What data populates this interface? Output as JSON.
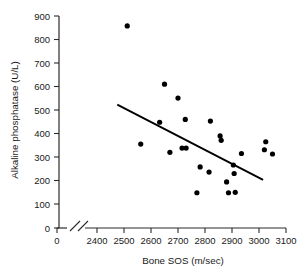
{
  "chart_data": {
    "type": "scatter",
    "title": "",
    "xlabel": "Bone SOS (m/sec)",
    "ylabel": "Alkaline phosphatase (U/L)",
    "xlim": [
      2400,
      3100
    ],
    "ylim": [
      0,
      900
    ],
    "x_ticks": [
      0,
      2400,
      2500,
      2600,
      2700,
      2800,
      2900,
      3000,
      3100
    ],
    "y_ticks": [
      0,
      100,
      200,
      300,
      400,
      500,
      600,
      700,
      800,
      900
    ],
    "x_axis_break": true,
    "grid": false,
    "legend": null,
    "series": [
      {
        "name": "Subjects",
        "marker": "filled-circle",
        "color": "#000000",
        "points": [
          {
            "x": 2512,
            "y": 860
          },
          {
            "x": 2562,
            "y": 357
          },
          {
            "x": 2650,
            "y": 612
          },
          {
            "x": 2632,
            "y": 450
          },
          {
            "x": 2700,
            "y": 553
          },
          {
            "x": 2670,
            "y": 322
          },
          {
            "x": 2727,
            "y": 462
          },
          {
            "x": 2715,
            "y": 340
          },
          {
            "x": 2730,
            "y": 340
          },
          {
            "x": 2782,
            "y": 260
          },
          {
            "x": 2770,
            "y": 150
          },
          {
            "x": 2820,
            "y": 455
          },
          {
            "x": 2815,
            "y": 238
          },
          {
            "x": 2856,
            "y": 392
          },
          {
            "x": 2860,
            "y": 373
          },
          {
            "x": 2880,
            "y": 196
          },
          {
            "x": 2887,
            "y": 150
          },
          {
            "x": 2905,
            "y": 268
          },
          {
            "x": 2908,
            "y": 232
          },
          {
            "x": 2912,
            "y": 152
          },
          {
            "x": 2935,
            "y": 317
          },
          {
            "x": 3020,
            "y": 333
          },
          {
            "x": 3025,
            "y": 367
          },
          {
            "x": 3050,
            "y": 315
          }
        ]
      }
    ],
    "trendline": {
      "type": "linear-fit",
      "x_start": 2475,
      "y_start": 525,
      "x_end": 3015,
      "y_end": 205
    }
  },
  "labels": {
    "y_tick_0": "0",
    "y_tick_100": "100",
    "y_tick_200": "200",
    "y_tick_300": "300",
    "y_tick_400": "400",
    "y_tick_500": "500",
    "y_tick_600": "600",
    "y_tick_700": "700",
    "y_tick_800": "800",
    "y_tick_900": "900",
    "x_tick_0": "0",
    "x_tick_2400": "2400",
    "x_tick_2500": "2500",
    "x_tick_2600": "2600",
    "x_tick_2700": "2700",
    "x_tick_2800": "2800",
    "x_tick_2900": "2900",
    "x_tick_3000": "3000",
    "x_tick_3100": "3100",
    "x_axis_title": "Bone SOS (m/sec)",
    "y_axis_title": "Alkaline phosphatase (U/L)"
  }
}
